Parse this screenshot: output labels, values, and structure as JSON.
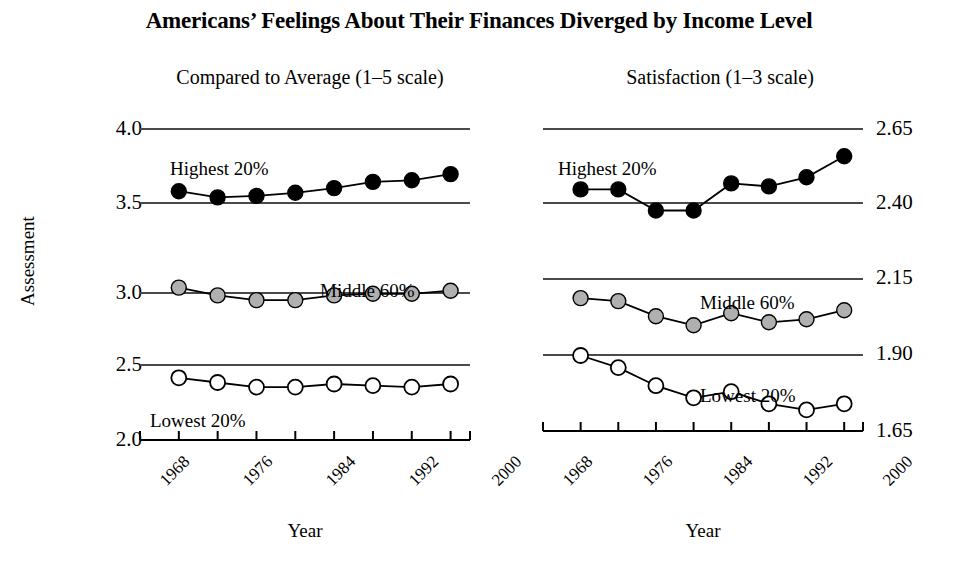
{
  "chart_data": {
    "type": "line",
    "title": "Americans’ Feelings About Their Finances Diverged by Income Level",
    "ylabel": "Assessment",
    "xlabel": "Year",
    "grid": true,
    "legend_position": "inline-annotations",
    "panels": [
      {
        "name": "left-panel",
        "subtitle": "Compared to Average (1–5 scale)",
        "xlabel": "Year",
        "ylabel": "Assessment",
        "xlim": [
          1968,
          2002
        ],
        "ylim": [
          2.0,
          4.0
        ],
        "yticks": [
          "4.0",
          "3.5",
          "3.0",
          "2.5",
          "2.0"
        ],
        "ytick_values": [
          4.0,
          3.5,
          3.0,
          2.5,
          2.0
        ],
        "xticks": [
          "1968",
          "1976",
          "1984",
          "1992",
          "2000"
        ],
        "xtick_values": [
          1968,
          1976,
          1984,
          1992,
          2000
        ],
        "x": [
          1972,
          1976,
          1980,
          1984,
          1988,
          1992,
          1996,
          2000
        ],
        "series": [
          {
            "name": "Highest 20%",
            "marker": "filled-circle",
            "color": "#000000",
            "values": [
              3.6,
              3.56,
              3.57,
              3.59,
              3.62,
              3.66,
              3.67,
              3.71
            ]
          },
          {
            "name": "Middle 60%",
            "marker": "gray-circle",
            "color": "#b0b0b0",
            "values": [
              2.98,
              2.93,
              2.9,
              2.9,
              2.93,
              2.94,
              2.94,
              2.96
            ]
          },
          {
            "name": "Lowest 20%",
            "marker": "open-circle",
            "color": "#ffffff",
            "values": [
              2.4,
              2.37,
              2.34,
              2.34,
              2.36,
              2.35,
              2.34,
              2.36
            ]
          }
        ]
      },
      {
        "name": "right-panel",
        "subtitle": "Satisfaction (1–3 scale)",
        "xlabel": "Year",
        "ylabel": "Assessment",
        "xlim": [
          1968,
          2002
        ],
        "ylim": [
          1.65,
          2.65
        ],
        "yticks": [
          "2.65",
          "2.40",
          "2.15",
          "1.90",
          "1.65"
        ],
        "ytick_values": [
          2.65,
          2.4,
          2.15,
          1.9,
          1.65
        ],
        "xticks": [
          "1968",
          "1976",
          "1984",
          "1992",
          "2000"
        ],
        "xtick_values": [
          1968,
          1976,
          1984,
          1992,
          2000
        ],
        "x": [
          1972,
          1976,
          1980,
          1984,
          1988,
          1992,
          1996,
          2000
        ],
        "series": [
          {
            "name": "Highest 20%",
            "marker": "filled-circle",
            "color": "#000000",
            "values": [
              2.45,
              2.45,
              2.38,
              2.38,
              2.47,
              2.46,
              2.49,
              2.56
            ]
          },
          {
            "name": "Middle 60%",
            "marker": "gray-circle",
            "color": "#b0b0b0",
            "values": [
              2.09,
              2.08,
              2.03,
              2.0,
              2.04,
              2.01,
              2.02,
              2.05
            ]
          },
          {
            "name": "Lowest 20%",
            "marker": "open-circle",
            "color": "#ffffff",
            "values": [
              1.9,
              1.86,
              1.8,
              1.76,
              1.78,
              1.74,
              1.72,
              1.74
            ]
          }
        ]
      }
    ],
    "annotations": [
      {
        "panel": "left",
        "text": "Highest 20%",
        "x_px": 170,
        "y_px": 158
      },
      {
        "panel": "left",
        "text": "Middle 60%",
        "x_px": 320,
        "y_px": 280
      },
      {
        "panel": "left",
        "text": "Lowest 20%",
        "x_px": 150,
        "y_px": 410
      },
      {
        "panel": "right",
        "text": "Highest 20%",
        "x_px": 558,
        "y_px": 158
      },
      {
        "panel": "right",
        "text": "Middle 60%",
        "x_px": 700,
        "y_px": 292
      },
      {
        "panel": "right",
        "text": "Lowest 20%",
        "x_px": 700,
        "y_px": 385
      }
    ]
  },
  "colors": {
    "background": "#ffffff",
    "ink": "#000000",
    "gridline": "#4a4a4a",
    "marker_high": "#000000",
    "marker_mid": "#b0b0b0",
    "marker_low": "#ffffff"
  }
}
